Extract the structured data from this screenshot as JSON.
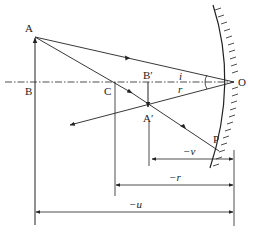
{
  "diagram": {
    "points": {
      "A": "A",
      "B": "B",
      "C": "C",
      "B_prime": "B′",
      "A_prime": "A′",
      "O": "O",
      "P": "P"
    },
    "angles": {
      "incidence": "i",
      "reflection": "r"
    },
    "dimensions": {
      "image_distance": "−v",
      "radius": "−r",
      "object_distance": "−u"
    },
    "colors": {
      "line": "#222222",
      "background": "#ffffff"
    }
  }
}
